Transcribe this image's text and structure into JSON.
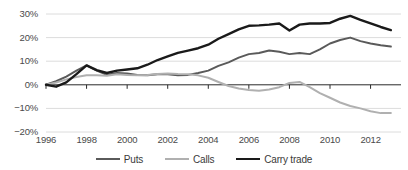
{
  "chart_data": {
    "type": "line",
    "title": "",
    "xlabel": "",
    "ylabel": "",
    "xlim": [
      1996,
      2013.5
    ],
    "ylim": [
      -20,
      30
    ],
    "grid": true,
    "y_ticks": [
      30,
      20,
      10,
      0,
      -10,
      -20
    ],
    "y_tick_labels": [
      "30%",
      "20%",
      "10%",
      "0%",
      "−10%",
      "−20%"
    ],
    "x_ticks": [
      1996,
      1998,
      2000,
      2002,
      2004,
      2006,
      2008,
      2010,
      2012
    ],
    "x_tick_labels": [
      "1996",
      "1998",
      "2000",
      "2002",
      "2004",
      "2006",
      "2008",
      "2010",
      "2012"
    ],
    "x": [
      1996,
      1996.5,
      1997,
      1997.5,
      1998,
      1998.5,
      1999,
      1999.5,
      2000,
      2000.5,
      2001,
      2001.5,
      2002,
      2002.5,
      2003,
      2003.5,
      2004,
      2004.5,
      2005,
      2005.5,
      2006,
      2006.5,
      2007,
      2007.5,
      2008,
      2008.5,
      2009,
      2009.5,
      2010,
      2010.5,
      2011,
      2011.5,
      2012,
      2012.5,
      2013
    ],
    "legend_position": "bottom-center",
    "series": [
      {
        "name": "Puts",
        "color": "#5a5a5a",
        "width": 2.0,
        "values": [
          0,
          1.5,
          3.5,
          6.0,
          8.2,
          6.0,
          4.2,
          5.0,
          4.8,
          4.2,
          4.0,
          4.5,
          4.5,
          4.0,
          4.2,
          5.0,
          6.0,
          8.0,
          9.5,
          11.5,
          13.0,
          13.5,
          14.5,
          14.0,
          13.0,
          13.5,
          13.0,
          15.0,
          17.5,
          19.0,
          20.0,
          18.5,
          17.5,
          16.8,
          16.2
        ]
      },
      {
        "name": "Calls",
        "color": "#b0b0b0",
        "width": 2.0,
        "values": [
          0,
          1.0,
          2.3,
          3.3,
          4.0,
          4.0,
          3.8,
          4.5,
          4.2,
          4.0,
          4.2,
          4.6,
          4.8,
          4.6,
          4.5,
          4.0,
          3.0,
          1.2,
          -0.5,
          -1.6,
          -2.2,
          -2.5,
          -2.0,
          -1.0,
          0.8,
          1.2,
          -1.0,
          -3.5,
          -5.5,
          -7.5,
          -9.0,
          -10.0,
          -11.2,
          -12.0,
          -12.0
        ]
      },
      {
        "name": "Carry trade",
        "color": "#1a1a1a",
        "width": 2.4,
        "values": [
          0,
          -0.8,
          1.0,
          4.5,
          8.2,
          6.2,
          5.0,
          6.0,
          6.5,
          7.0,
          8.5,
          10.5,
          12.0,
          13.5,
          14.5,
          15.5,
          17.0,
          19.5,
          21.5,
          23.5,
          25.0,
          25.2,
          25.5,
          26.0,
          23.0,
          25.5,
          26.0,
          26.0,
          26.2,
          28.0,
          29.2,
          27.5,
          26.0,
          24.5,
          23.2
        ]
      }
    ]
  },
  "legend": {
    "items": [
      {
        "label": "Puts",
        "color": "#5a5a5a",
        "thickness": "2px"
      },
      {
        "label": "Calls",
        "color": "#b0b0b0",
        "thickness": "2px"
      },
      {
        "label": "Carry trade",
        "color": "#1a1a1a",
        "thickness": "2.4px"
      }
    ]
  }
}
